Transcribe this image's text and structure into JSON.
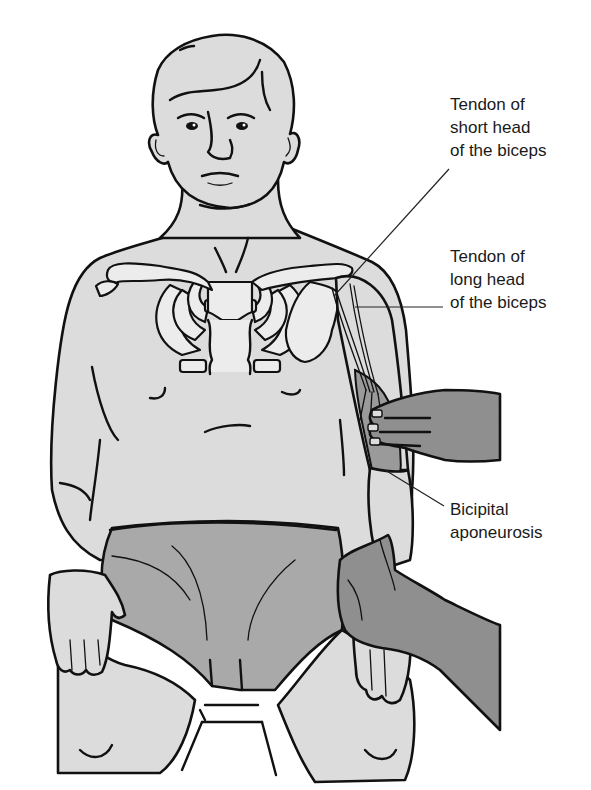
{
  "figure": {
    "colors": {
      "background": "#ffffff",
      "skin": "#dcdcdc",
      "shorts": "#a9a9a9",
      "examiner_hands": "#8f8f8f",
      "bone": "#ececec",
      "biceps_muscle": "#9a9a9a",
      "outline": "#111111"
    }
  },
  "labels": {
    "short_head": {
      "lines": [
        "Tendon of",
        "short head",
        "of the biceps"
      ]
    },
    "long_head": {
      "lines": [
        "Tendon of",
        "long head",
        "of the biceps"
      ]
    },
    "aponeurosis": {
      "lines": [
        "Bicipital",
        "aponeurosis"
      ]
    }
  }
}
